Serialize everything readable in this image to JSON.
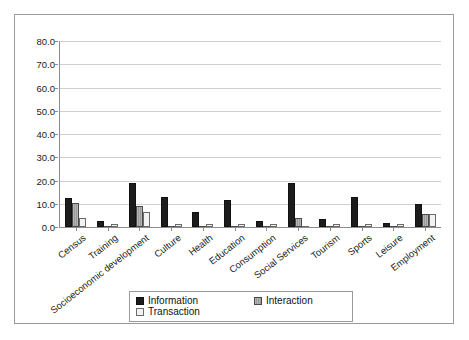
{
  "chart_data": {
    "type": "bar",
    "title": "",
    "subtitle": "",
    "xlabel": "",
    "ylabel": "",
    "ylim": [
      0,
      80
    ],
    "ytick_step": 10,
    "ytick_labels": [
      "80.0",
      "70.0",
      "60.0",
      "50.0",
      "40.0",
      "30.0",
      "20.0",
      "10.0",
      "0.0"
    ],
    "grid": true,
    "legend_position": "bottom",
    "categories": [
      "Census",
      "Training",
      "Socioeconomic development",
      "Culture",
      "Health",
      "Education",
      "Consumption",
      "Social Services",
      "Tourism",
      "Sports",
      "Leisure",
      "Employment"
    ],
    "series": [
      {
        "name": "Information",
        "color": "#1c1c1c",
        "values": [
          12.5,
          2.5,
          19.0,
          12.8,
          6.5,
          11.5,
          2.5,
          19.0,
          3.5,
          12.8,
          1.8,
          10.0
        ]
      },
      {
        "name": "Interaction",
        "color": "#a8a8a8",
        "values": [
          10.5,
          0.0,
          9.0,
          0.0,
          0.0,
          0.0,
          0.0,
          3.8,
          0.0,
          0.0,
          0.0,
          5.5
        ]
      },
      {
        "name": "Transaction",
        "color": "#f2f2f2",
        "values": [
          4.0,
          1.2,
          6.5,
          1.2,
          1.2,
          1.2,
          1.2,
          0.0,
          1.2,
          1.2,
          1.2,
          5.5
        ]
      }
    ]
  },
  "legend": {
    "items": [
      {
        "label": "Information",
        "swatch": "black-square-swatch"
      },
      {
        "label": "Interaction",
        "swatch": "gray-hatched-square-swatch"
      },
      {
        "label": "Transaction",
        "swatch": "white-square-swatch"
      }
    ]
  }
}
